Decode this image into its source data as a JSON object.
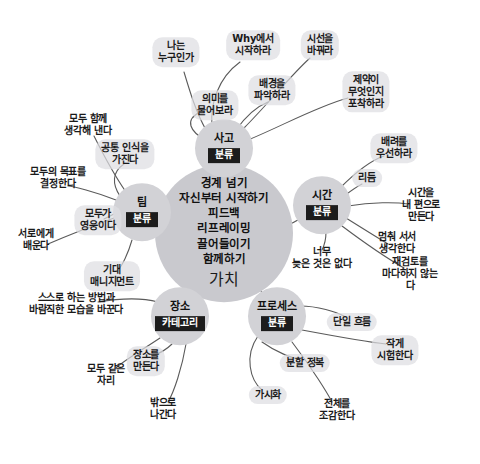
{
  "diagram": {
    "type": "mind-map",
    "title_center": {
      "lines": "경계 넘기\n자신부터 시작하기\n피드백\n리프레이밍\n끌어들이기\n함께하기",
      "tag": "가치"
    },
    "colors": {
      "background": "#ffffff",
      "hub_fill": "#d2d2d6",
      "center_fill": "#c9c9ce",
      "leaf_fill": "#dedee2",
      "tag_bg": "#1c1c1c",
      "tag_text": "#ffffff",
      "edge": "#555555",
      "text": "#1a1a1a"
    },
    "hubs": [
      {
        "id": "thinking",
        "title": "사고",
        "tag": "분류",
        "x": 224,
        "y": 148
      },
      {
        "id": "time",
        "title": "시간",
        "tag": "분류",
        "x": 322,
        "y": 205
      },
      {
        "id": "team",
        "title": "팀",
        "tag": "분류",
        "x": 142,
        "y": 212
      },
      {
        "id": "place",
        "title": "장소",
        "tag": "카테고리",
        "x": 180,
        "y": 316
      },
      {
        "id": "process",
        "title": "프로세스",
        "tag": "분류",
        "x": 277,
        "y": 316
      }
    ],
    "leaves": [
      {
        "id": "who-am-i",
        "hub": "thinking",
        "text": "나는\n누구인가",
        "x": 176,
        "y": 52
      },
      {
        "id": "start-with-why",
        "hub": "thinking",
        "text": "Why에서\n시작하라",
        "x": 253,
        "y": 45
      },
      {
        "id": "ask-meaning",
        "hub": "thinking",
        "text": "의미를\n물어보라",
        "x": 215,
        "y": 105
      },
      {
        "id": "change-view",
        "hub": "thinking",
        "text": "시선을\n바꿔라",
        "x": 320,
        "y": 45
      },
      {
        "id": "grasp-context",
        "hub": "thinking",
        "text": "배경을\n파악하라",
        "x": 272,
        "y": 90
      },
      {
        "id": "catch-constraint",
        "hub": "thinking",
        "text": "제약이\n무엇인지\n포착하라",
        "x": 366,
        "y": 92
      },
      {
        "id": "care-first",
        "hub": "time",
        "text": "배려를\n우선하라",
        "x": 394,
        "y": 148
      },
      {
        "id": "rhythm",
        "hub": "time",
        "text": "리듬",
        "x": 367,
        "y": 178
      },
      {
        "id": "time-on-my-side",
        "hub": "time",
        "text": "시간을\n내 편으로 만든다",
        "x": 421,
        "y": 205
      },
      {
        "id": "stop-and-think",
        "hub": "time",
        "text": "멈춰 서서\n생각한다",
        "x": 397,
        "y": 243
      },
      {
        "id": "never-too-late",
        "hub": "time",
        "text": "너무\n늦은 것은 없다",
        "x": 322,
        "y": 258
      },
      {
        "id": "review-always",
        "hub": "time",
        "text": "재검토를\n마다하지 않는다",
        "x": 410,
        "y": 274
      },
      {
        "id": "think-together",
        "hub": "team",
        "text": "모두 함께\n생각해 낸다",
        "x": 88,
        "y": 125
      },
      {
        "id": "shared-awareness",
        "hub": "team",
        "text": "공통 인식을\n가진다",
        "x": 125,
        "y": 154
      },
      {
        "id": "decide-goal",
        "hub": "team",
        "text": "모두의 목표를\n결정한다",
        "x": 58,
        "y": 178
      },
      {
        "id": "all-heroes",
        "hub": "team",
        "text": "모두가\n영웅이다",
        "x": 98,
        "y": 220
      },
      {
        "id": "learn-each",
        "hub": "team",
        "text": "서로에게\n배운다",
        "x": 36,
        "y": 240
      },
      {
        "id": "expect-mgmt",
        "hub": "team",
        "text": "기대\n매니지먼트",
        "x": 112,
        "y": 276
      },
      {
        "id": "change-method",
        "hub": "place",
        "text": "스스로 하는 방법과\n바람직한 모습을 바꾼다",
        "x": 76,
        "y": 304
      },
      {
        "id": "make-place",
        "hub": "place",
        "text": "장소를\n만든다",
        "x": 146,
        "y": 361
      },
      {
        "id": "same-seat",
        "hub": "place",
        "text": "모두 같은\n자리",
        "x": 106,
        "y": 375
      },
      {
        "id": "go-outside",
        "hub": "place",
        "text": "밖으로\n나간다",
        "x": 163,
        "y": 409
      },
      {
        "id": "single-flow",
        "hub": "process",
        "text": "단일 흐름",
        "x": 352,
        "y": 322
      },
      {
        "id": "divide-conquer",
        "hub": "process",
        "text": "분할 정복",
        "x": 305,
        "y": 363
      },
      {
        "id": "test-small",
        "hub": "process",
        "text": "작게\n시험한다",
        "x": 395,
        "y": 350
      },
      {
        "id": "visualize",
        "hub": "process",
        "text": "가시화",
        "x": 268,
        "y": 395
      },
      {
        "id": "see-whole",
        "hub": "process",
        "text": "전체를\n조감한다",
        "x": 337,
        "y": 410
      }
    ]
  }
}
